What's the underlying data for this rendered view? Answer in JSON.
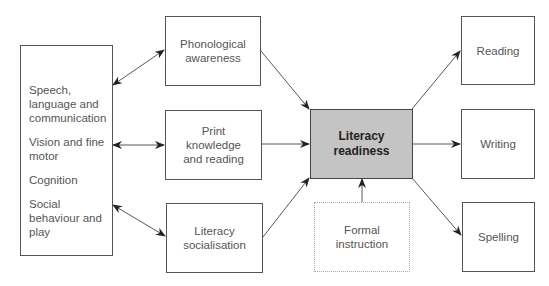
{
  "diagram": {
    "factors_box": {
      "items": [
        "Speech, language and communication",
        "Vision and fine motor",
        "Cognition",
        "Social behaviour and play"
      ]
    },
    "middle": {
      "phonological": "Phonological awareness",
      "print": "Print knowledge and reading",
      "socialisation": "Literacy socialisation"
    },
    "central": "Literacy readiness",
    "formal": "Formal instruction",
    "outcomes": {
      "reading": "Reading",
      "writing": "Writing",
      "spelling": "Spelling"
    },
    "colors": {
      "central_fill": "#c4c4c4",
      "border": "#555555",
      "dotted_border": "#aaaaaa"
    }
  }
}
